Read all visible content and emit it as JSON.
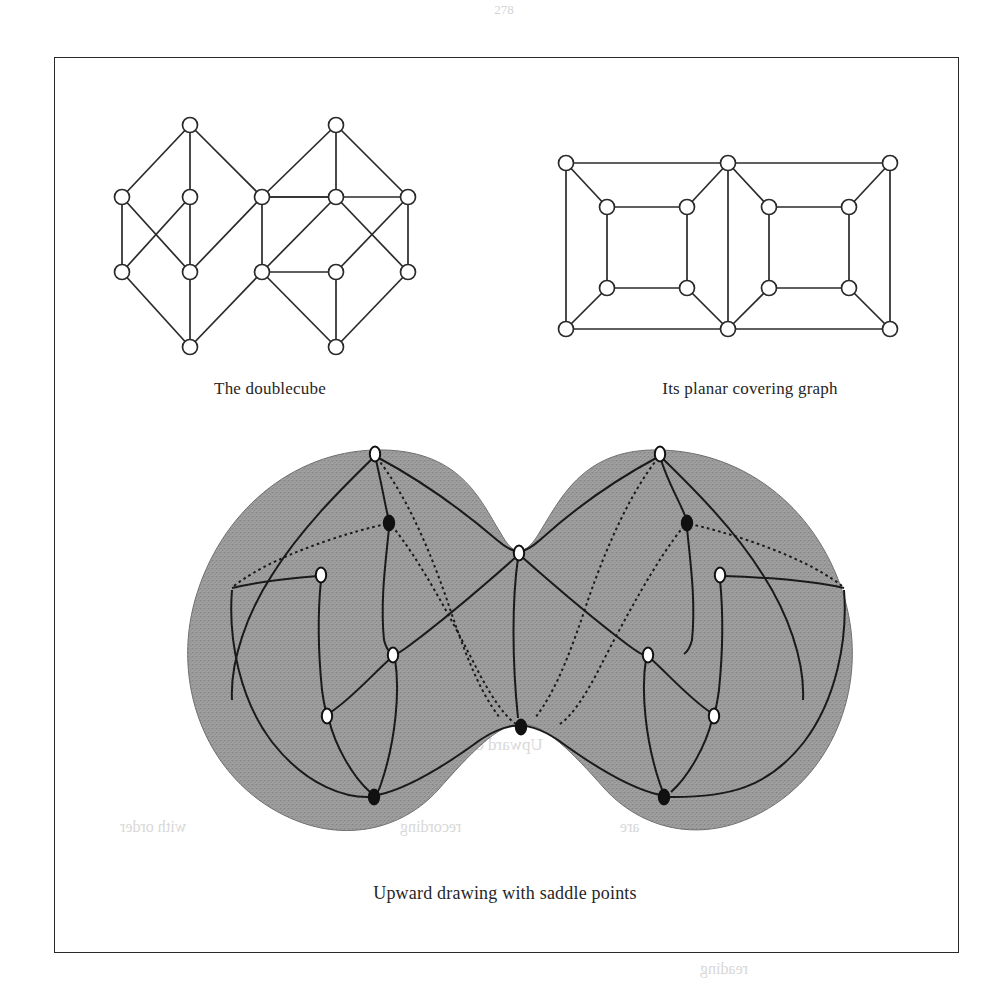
{
  "page": {
    "folio": "278",
    "background_color": "#ffffff",
    "ink_color": "#1a1a1a",
    "frame": {
      "x": 54,
      "y": 57,
      "width": 905,
      "height": 896,
      "border_color": "#2a2a2a"
    }
  },
  "captions": {
    "doublecube": "The doublecube",
    "planar": "Its planar covering graph",
    "upward": "Upward drawing with saddle points"
  },
  "bleed_through": [
    {
      "text": "Fig.",
      "x": 230,
      "y": 735,
      "size": 16
    },
    {
      "text": "Upward drawing with saddle points",
      "x": 300,
      "y": 735,
      "size": 17
    },
    {
      "text": "with order",
      "x": 120,
      "y": 818,
      "size": 16
    },
    {
      "text": "recording",
      "x": 400,
      "y": 818,
      "size": 16
    },
    {
      "text": "are",
      "x": 620,
      "y": 818,
      "size": 16
    },
    {
      "text": "reading",
      "x": 700,
      "y": 960,
      "size": 16
    }
  ],
  "figures": {
    "doublecube": {
      "label": "The doublecube",
      "type": "hasse-diagram",
      "node_radius": 7.5,
      "node_fill": "#ffffff",
      "node_stroke": "#2a2a2a",
      "edge_color": "#2a2a2a",
      "edge_width": 1.7,
      "nodes": [
        {
          "id": "L_top",
          "x": 190,
          "y": 125
        },
        {
          "id": "L_a",
          "x": 122,
          "y": 197
        },
        {
          "id": "L_b",
          "x": 190,
          "y": 197
        },
        {
          "id": "M_top",
          "x": 262,
          "y": 197
        },
        {
          "id": "L_c",
          "x": 122,
          "y": 272
        },
        {
          "id": "L_d",
          "x": 190,
          "y": 272
        },
        {
          "id": "M_bot",
          "x": 262,
          "y": 272
        },
        {
          "id": "L_bottom",
          "x": 190,
          "y": 347
        },
        {
          "id": "R_top",
          "x": 336,
          "y": 125
        },
        {
          "id": "R_b",
          "x": 336,
          "y": 197
        },
        {
          "id": "R_a",
          "x": 408,
          "y": 197
        },
        {
          "id": "R_d",
          "x": 336,
          "y": 272
        },
        {
          "id": "R_c",
          "x": 408,
          "y": 272
        },
        {
          "id": "R_bottom",
          "x": 336,
          "y": 347
        }
      ],
      "edges": [
        [
          "L_top",
          "L_a"
        ],
        [
          "L_top",
          "L_b"
        ],
        [
          "L_top",
          "M_top"
        ],
        [
          "L_a",
          "L_c"
        ],
        [
          "L_a",
          "L_d"
        ],
        [
          "L_b",
          "L_c"
        ],
        [
          "L_b",
          "L_d"
        ],
        [
          "M_top",
          "L_d"
        ],
        [
          "M_top",
          "M_bot"
        ],
        [
          "L_c",
          "L_bottom"
        ],
        [
          "L_d",
          "L_bottom"
        ],
        [
          "M_bot",
          "L_bottom"
        ],
        [
          "M_top",
          "R_b"
        ],
        [
          "M_top",
          "R_a"
        ],
        [
          "R_top",
          "M_top"
        ],
        [
          "R_top",
          "R_b"
        ],
        [
          "R_top",
          "R_a"
        ],
        [
          "R_b",
          "M_bot"
        ],
        [
          "R_b",
          "R_c"
        ],
        [
          "R_a",
          "R_d"
        ],
        [
          "R_a",
          "R_c"
        ],
        [
          "R_d",
          "M_bot"
        ],
        [
          "M_bot",
          "R_bottom"
        ],
        [
          "R_d",
          "R_bottom"
        ],
        [
          "R_c",
          "R_bottom"
        ]
      ]
    },
    "planar": {
      "label": "Its planar covering graph",
      "type": "planar-embedding",
      "node_radius": 7.5,
      "node_fill": "#ffffff",
      "node_stroke": "#2a2a2a",
      "edge_color": "#2a2a2a",
      "edge_width": 1.7,
      "nodes": [
        {
          "id": "P1",
          "x": 566,
          "y": 163
        },
        {
          "id": "P2",
          "x": 607,
          "y": 207
        },
        {
          "id": "P3",
          "x": 687,
          "y": 207
        },
        {
          "id": "P4",
          "x": 728,
          "y": 163
        },
        {
          "id": "P5",
          "x": 607,
          "y": 288
        },
        {
          "id": "P6",
          "x": 687,
          "y": 288
        },
        {
          "id": "P7",
          "x": 566,
          "y": 329
        },
        {
          "id": "P8",
          "x": 728,
          "y": 329
        },
        {
          "id": "P9",
          "x": 769,
          "y": 207
        },
        {
          "id": "P10",
          "x": 849,
          "y": 207
        },
        {
          "id": "P11",
          "x": 890,
          "y": 163
        },
        {
          "id": "P12",
          "x": 769,
          "y": 288
        },
        {
          "id": "P13",
          "x": 849,
          "y": 288
        },
        {
          "id": "P14",
          "x": 890,
          "y": 329
        }
      ],
      "edges": [
        [
          "P1",
          "P4"
        ],
        [
          "P1",
          "P2"
        ],
        [
          "P1",
          "P7"
        ],
        [
          "P2",
          "P3"
        ],
        [
          "P2",
          "P5"
        ],
        [
          "P3",
          "P6"
        ],
        [
          "P3",
          "P4"
        ],
        [
          "P4",
          "P11"
        ],
        [
          "P4",
          "P8"
        ],
        [
          "P5",
          "P6"
        ],
        [
          "P5",
          "P7"
        ],
        [
          "P6",
          "P8"
        ],
        [
          "P7",
          "P8"
        ],
        [
          "P4",
          "P9"
        ],
        [
          "P9",
          "P10"
        ],
        [
          "P9",
          "P12"
        ],
        [
          "P10",
          "P11"
        ],
        [
          "P10",
          "P13"
        ],
        [
          "P11",
          "P14"
        ],
        [
          "P12",
          "P13"
        ],
        [
          "P12",
          "P8"
        ],
        [
          "P13",
          "P14"
        ],
        [
          "P8",
          "P14"
        ]
      ]
    },
    "upward": {
      "label": "Upward drawing with saddle points",
      "type": "surface-drawing",
      "surface_fill": "#9a9a9a",
      "surface_texture": "stipple",
      "edge_color": "#1a1a1a",
      "edge_width": 2.0,
      "node_fill_open": "#ffffff",
      "node_fill_closed": "#111111",
      "node_stroke": "#111111",
      "vertices": [
        {
          "id": "U_left_top",
          "x": 375,
          "y": 454,
          "fill": "open",
          "role": "source"
        },
        {
          "id": "U_right_top",
          "x": 660,
          "y": 454,
          "fill": "open",
          "role": "source"
        },
        {
          "id": "U_left_saddle",
          "x": 389,
          "y": 523,
          "fill": "closed",
          "role": "saddle"
        },
        {
          "id": "U_right_saddle",
          "x": 687,
          "y": 523,
          "fill": "closed",
          "role": "saddle"
        },
        {
          "id": "U_mid_top",
          "x": 519,
          "y": 553,
          "fill": "open",
          "role": "saddle-top"
        },
        {
          "id": "U_left_mid",
          "x": 321,
          "y": 575,
          "fill": "open",
          "role": "internal"
        },
        {
          "id": "U_right_mid",
          "x": 720,
          "y": 575,
          "fill": "open",
          "role": "internal"
        },
        {
          "id": "U_left_low",
          "x": 393,
          "y": 655,
          "fill": "open",
          "role": "internal"
        },
        {
          "id": "U_right_low",
          "x": 648,
          "y": 655,
          "fill": "open",
          "role": "internal"
        },
        {
          "id": "U_left_outer",
          "x": 327,
          "y": 716,
          "fill": "open",
          "role": "internal"
        },
        {
          "id": "U_right_outer",
          "x": 714,
          "y": 716,
          "fill": "open",
          "role": "internal"
        },
        {
          "id": "U_mid_bot",
          "x": 521,
          "y": 727,
          "fill": "closed",
          "role": "saddle-bottom"
        },
        {
          "id": "U_left_bottom",
          "x": 374,
          "y": 797,
          "fill": "closed",
          "role": "sink"
        },
        {
          "id": "U_right_bottom",
          "x": 664,
          "y": 797,
          "fill": "closed",
          "role": "sink"
        }
      ]
    }
  }
}
